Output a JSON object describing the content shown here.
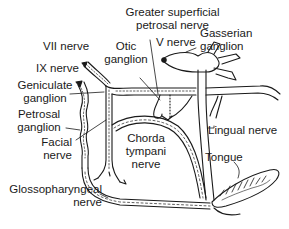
{
  "diagram": {
    "type": "anatomical-nerve-pathway",
    "labels": {
      "greater_superficial_line1": "Greater superficial",
      "greater_superficial_line2": "petrosal nerve",
      "v_nerve": "V nerve",
      "gasserian_line1": "Gasserian",
      "gasserian_line2": "ganglion",
      "vii_nerve": "VII nerve",
      "otic_line1": "Otic",
      "otic_line2": "ganglion",
      "ix_nerve": "IX nerve",
      "geniculate_line1": "Geniculate",
      "geniculate_line2": "ganglion",
      "petrosal_line1": "Petrosal",
      "petrosal_line2": "ganglion",
      "facial_line1": "Facial",
      "facial_line2": "nerve",
      "chorda_line1": "Chorda",
      "chorda_line2": "tympani",
      "chorda_line3": "nerve",
      "lingual_nerve": "Lingual nerve",
      "tongue": "Tongue",
      "glosso_line1": "Glossopharyngeal",
      "glosso_line2": "nerve"
    },
    "colors": {
      "ink": "#1a1a1a",
      "background": "#ffffff"
    }
  }
}
